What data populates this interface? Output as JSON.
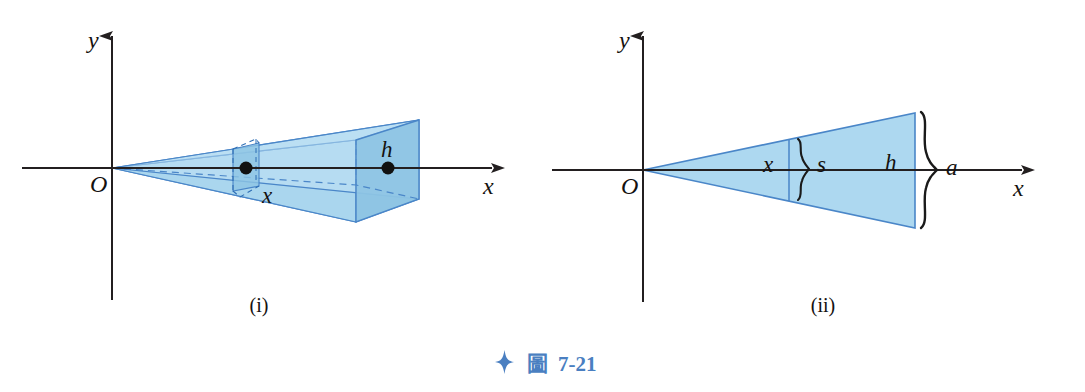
{
  "figure": {
    "caption": {
      "icon": "four-point-star-icon",
      "cjk_label": "圖",
      "number": "7-21",
      "color": "#4a7fc1"
    },
    "panels": [
      {
        "id": "i",
        "panel_label": "(i)",
        "description": "Pyramid with apex at origin, base perpendicular to x-axis",
        "axes": {
          "y_label": "y",
          "x_label": "x",
          "origin_label": "O"
        },
        "labels": [
          {
            "name": "cross-section-distance",
            "text": "x"
          },
          {
            "name": "pyramid-height",
            "text": "h"
          }
        ],
        "markers": [
          {
            "name": "cross-section-center-dot"
          },
          {
            "name": "base-center-dot"
          }
        ]
      },
      {
        "id": "ii",
        "panel_label": "(ii)",
        "description": "Cross-sectional triangle view of pyramid from apex at origin",
        "axes": {
          "y_label": "y",
          "x_label": "x",
          "origin_label": "O"
        },
        "labels": [
          {
            "name": "cross-section-distance",
            "text": "x"
          },
          {
            "name": "cross-section-side",
            "text": "s"
          },
          {
            "name": "pyramid-height",
            "text": "h"
          },
          {
            "name": "base-side",
            "text": "a"
          }
        ]
      }
    ],
    "colors": {
      "fill_light": "#b6dcf2",
      "fill_mid": "#9ccee9",
      "fill_dark": "#8dc4e4",
      "stroke_blue": "#4a86c8",
      "axis_black": "#231f20",
      "caption_blue": "#4a7fc1"
    }
  }
}
